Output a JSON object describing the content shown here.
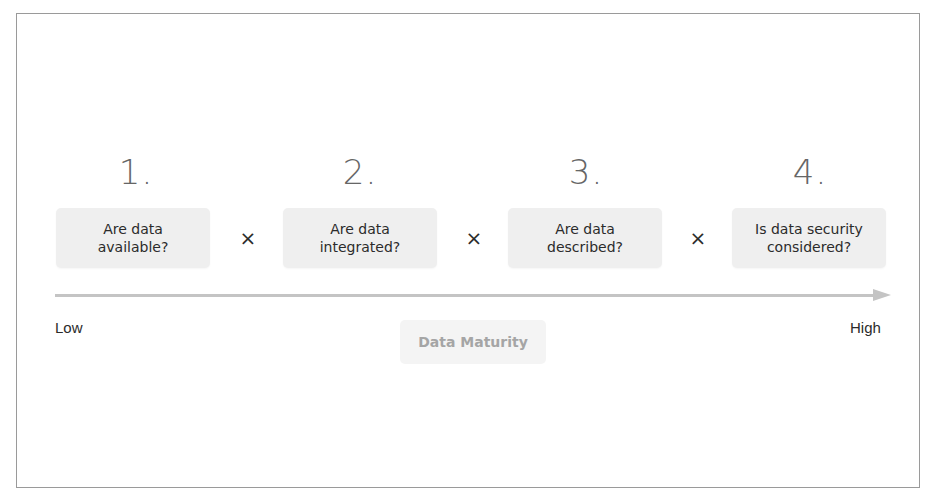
{
  "diagram": {
    "steps": [
      {
        "number": "1.",
        "question": "Are data available?"
      },
      {
        "number": "2.",
        "question": "Are data integrated?"
      },
      {
        "number": "3.",
        "question": "Are data described?"
      },
      {
        "number": "4.",
        "question": "Is data security considered?"
      }
    ],
    "operator": "×",
    "axis": {
      "low_label": "Low",
      "high_label": "High",
      "title": "Data Maturity"
    },
    "colors": {
      "box_fill": "#efefef",
      "arrow": "#c4c4c4",
      "number_text": "#666666",
      "axis_title_text": "#a5a5a5",
      "frame_border": "#9a9a9a"
    }
  }
}
